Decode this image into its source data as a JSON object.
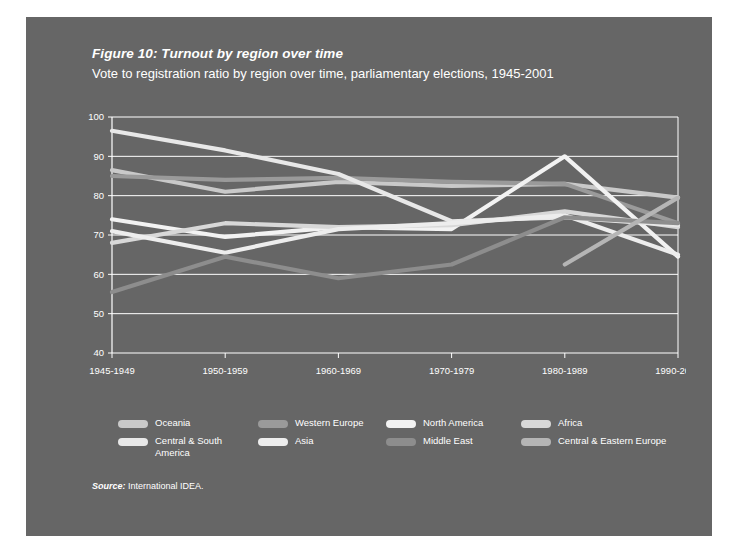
{
  "figure": {
    "title": "Figure 10: Turnout by region over time",
    "subtitle": "Vote to registration ratio by region over time, parliamentary elections, 1945-2001",
    "source_word": "Source:",
    "source_text": " International IDEA.",
    "panel_color": "#666666",
    "page_color": "#ffffff"
  },
  "legend": {
    "rows": [
      [
        {
          "label": "Oceania",
          "color": "#c9c9c9",
          "name": "legend-item-oceania"
        },
        {
          "label": "Western Europe",
          "color": "#9a9a9a",
          "name": "legend-item-western-europe"
        },
        {
          "label": "North America",
          "color": "#f2f2f2",
          "name": "legend-item-north-america"
        },
        {
          "label": "Africa",
          "color": "#d8d8d8",
          "name": "legend-item-africa"
        }
      ],
      [
        {
          "label": "Central & South America",
          "color": "#e8e8e8",
          "name": "legend-item-central-south-america"
        },
        {
          "label": "Asia",
          "color": "#ededed",
          "name": "legend-item-asia"
        },
        {
          "label": "Middle East",
          "color": "#8d8d8d",
          "name": "legend-item-middle-east"
        },
        {
          "label": "Central & Eastern Europe",
          "color": "#b5b5b5",
          "name": "legend-item-central-eastern-europe"
        }
      ]
    ]
  },
  "chart_data": {
    "type": "line",
    "title": "Figure 10: Turnout by region over time",
    "subtitle": "Vote to registration ratio by region over time, parliamentary elections, 1945-2001",
    "xlabel": "",
    "ylabel": "",
    "ylim": [
      40,
      100
    ],
    "yticks": [
      40,
      50,
      60,
      70,
      80,
      90,
      100
    ],
    "grid": true,
    "legend_position": "bottom",
    "categories": [
      "1945-1949",
      "1950-1959",
      "1960-1969",
      "1970-1979",
      "1980-1989",
      "1990-2001"
    ],
    "series": [
      {
        "name": "Oceania",
        "color": "#c9c9c9",
        "values": [
          86.5,
          81.0,
          83.5,
          82.5,
          83.0,
          79.5
        ]
      },
      {
        "name": "Western Europe",
        "color": "#9a9a9a",
        "values": [
          85.0,
          84.0,
          84.5,
          83.5,
          83.0,
          73.0
        ]
      },
      {
        "name": "North America",
        "color": "#f2f2f2",
        "values": [
          74.0,
          69.5,
          72.0,
          71.5,
          90.0,
          64.5
        ]
      },
      {
        "name": "Africa",
        "color": "#d8d8d8",
        "values": [
          68.0,
          73.0,
          72.0,
          72.5,
          76.0,
          72.0
        ]
      },
      {
        "name": "Central & South America",
        "color": "#e8e8e8",
        "values": [
          96.5,
          91.5,
          85.5,
          73.5,
          74.5,
          72.5
        ]
      },
      {
        "name": "Asia",
        "color": "#ededed",
        "values": [
          71.0,
          65.5,
          71.5,
          73.0,
          75.0,
          65.0
        ]
      },
      {
        "name": "Middle East",
        "color": "#8d8d8d",
        "values": [
          55.5,
          64.5,
          59.0,
          62.5,
          74.5,
          73.0
        ]
      },
      {
        "name": "Central & Eastern Europe",
        "color": "#b5b5b5",
        "values": [
          null,
          null,
          null,
          null,
          62.5,
          79.5
        ]
      }
    ]
  }
}
